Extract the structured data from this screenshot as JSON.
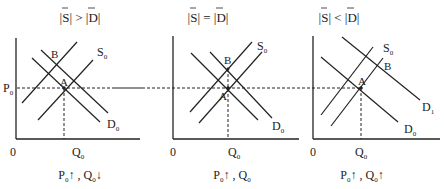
{
  "figure": {
    "shared_price_label": "P",
    "shared_price_sub": "0",
    "panels": [
      {
        "title": {
          "left": "S",
          "op": ">",
          "right": "D"
        },
        "origin": "0",
        "q_label": "Q",
        "q_sub": "0",
        "point_a": "A",
        "point_b": "B",
        "curves": [
          {
            "name": "S",
            "sub": "0"
          },
          {
            "name": "D",
            "sub": "0"
          }
        ],
        "caption": {
          "p": "P",
          "p_sub": "0",
          "p_arrow": "↑",
          "sep": " , ",
          "q": "Q",
          "q_sub": "0",
          "q_arrow": "↓"
        }
      },
      {
        "title": {
          "left": "S",
          "op": "=",
          "right": "D"
        },
        "origin": "0",
        "q_label": "Q",
        "q_sub": "0",
        "point_a": "A",
        "point_b": "B",
        "curves": [
          {
            "name": "S",
            "sub": "0"
          },
          {
            "name": "D",
            "sub": "0"
          }
        ],
        "caption": {
          "p": "P",
          "p_sub": "0",
          "p_arrow": "↑",
          "sep": " , ",
          "q": "Q",
          "q_sub": "0",
          "q_arrow": ""
        }
      },
      {
        "title": {
          "left": "S",
          "op": "<",
          "right": "D"
        },
        "origin": "0",
        "q_label": "Q",
        "q_sub": "0",
        "point_a": "A",
        "point_b": "B",
        "curves": [
          {
            "name": "S",
            "sub": "0"
          },
          {
            "name": "D",
            "sub": "1"
          },
          {
            "name": "D",
            "sub": "0"
          }
        ],
        "caption": {
          "p": "P",
          "p_sub": "0",
          "p_arrow": "↑",
          "sep": " , ",
          "q": "Q",
          "q_sub": "0",
          "q_arrow": "↑"
        }
      }
    ]
  }
}
